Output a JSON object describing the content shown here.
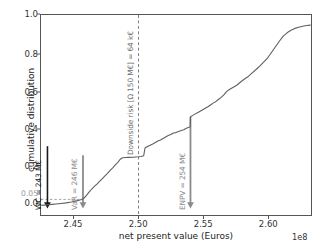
{
  "chart_data": {
    "type": "line",
    "title": "",
    "xlabel": "net present value (Euros)",
    "ylabel": "cumulative distribution",
    "x_exponent_label": "1e8",
    "xlim": [
      242450000.0,
      263350000.0
    ],
    "ylim": [
      -0.035,
      1.055
    ],
    "grid": false,
    "legend": null,
    "xticks": [
      "2.45",
      "2.50",
      "2.55",
      "2.60"
    ],
    "xtick_values": [
      245000000.0,
      250000000.0,
      255000000.0,
      260000000.0
    ],
    "yticks": [
      "0.0",
      "0.05",
      "0.2",
      "0.4",
      "0.6",
      "0.8",
      "1.0"
    ],
    "ytick_values": [
      0.0,
      0.05,
      0.2,
      0.4,
      0.6,
      0.8,
      1.0
    ],
    "series": [
      {
        "name": "cumulative distribution of NPV",
        "x": [
          2.425,
          2.427,
          2.43,
          2.433,
          2.436,
          2.44,
          2.444,
          2.448,
          2.452,
          2.456,
          2.458,
          2.46,
          2.462,
          2.464,
          2.466,
          2.468,
          2.47,
          2.472,
          2.474,
          2.476,
          2.478,
          2.48,
          2.482,
          2.484,
          2.4855,
          2.487,
          2.488,
          2.49,
          2.492,
          2.496,
          2.5,
          2.502,
          2.504,
          2.505,
          2.507,
          2.509,
          2.511,
          2.513,
          2.515,
          2.517,
          2.519,
          2.521,
          2.523,
          2.525,
          2.527,
          2.529,
          2.531,
          2.533,
          2.535,
          2.537,
          2.539,
          2.54,
          2.5402,
          2.542,
          2.544,
          2.546,
          2.548,
          2.55,
          2.552,
          2.554,
          2.556,
          2.558,
          2.56,
          2.562,
          2.564,
          2.566,
          2.568,
          2.57,
          2.573,
          2.576,
          2.579,
          2.582,
          2.585,
          2.588,
          2.591,
          2.594,
          2.597,
          2.6,
          2.603,
          2.606,
          2.609,
          2.612,
          2.615,
          2.618,
          2.621,
          2.624,
          2.627,
          2.63,
          2.633
        ],
        "y": [
          0.018,
          0.019,
          0.021,
          0.023,
          0.025,
          0.028,
          0.031,
          0.036,
          0.042,
          0.05,
          0.058,
          0.075,
          0.092,
          0.108,
          0.122,
          0.135,
          0.15,
          0.163,
          0.178,
          0.192,
          0.208,
          0.222,
          0.238,
          0.252,
          0.266,
          0.275,
          0.277,
          0.278,
          0.279,
          0.28,
          0.282,
          0.284,
          0.288,
          0.33,
          0.338,
          0.345,
          0.352,
          0.36,
          0.368,
          0.374,
          0.382,
          0.39,
          0.398,
          0.404,
          0.412,
          0.414,
          0.42,
          0.426,
          0.43,
          0.438,
          0.443,
          0.446,
          0.5,
          0.508,
          0.516,
          0.524,
          0.532,
          0.54,
          0.548,
          0.556,
          0.566,
          0.576,
          0.584,
          0.596,
          0.606,
          0.62,
          0.636,
          0.648,
          0.66,
          0.672,
          0.69,
          0.706,
          0.72,
          0.74,
          0.758,
          0.778,
          0.8,
          0.822,
          0.852,
          0.882,
          0.912,
          0.94,
          0.958,
          0.972,
          0.982,
          0.988,
          0.994,
          0.998,
          1.0
        ],
        "color": "#5f5f5f"
      }
    ],
    "annotations": [
      {
        "id": "wc",
        "label": "WC = 243 M€",
        "x_value": 242950000.0,
        "y_from": 0.34,
        "y_to": 0.0,
        "color": "#1a1a1a",
        "kind": "arrow"
      },
      {
        "id": "var",
        "label": "VaR = 246 M€",
        "x_value": 245700000.0,
        "y_from": 0.29,
        "y_to": 0.0,
        "color": "#8a8a8a",
        "kind": "arrow"
      },
      {
        "id": "downside-risk",
        "label": "Downside risk [Ω 150 M€] = 64 k€",
        "x_value": 250000000.0,
        "y_from": 1.055,
        "y_to": -0.035,
        "color": "#6e6e6e",
        "kind": "dashed-vertical"
      },
      {
        "id": "enpv",
        "label": "ENPV = 254 M€",
        "x_value": 254020000.0,
        "y_from": 0.5,
        "y_to": 0.0,
        "color": "#8a8a8a",
        "kind": "arrow"
      },
      {
        "id": "var-threshold",
        "label": "",
        "y_value": 0.05,
        "x_from": 242450000.0,
        "x_to": 245700000.0,
        "color": "#9a9a9a",
        "kind": "dashed-horizontal"
      }
    ]
  }
}
